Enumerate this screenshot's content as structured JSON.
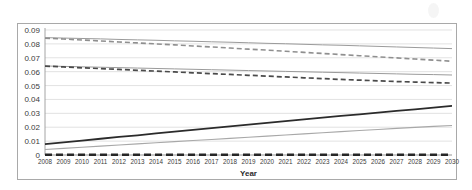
{
  "chart_data": {
    "type": "line",
    "title": "",
    "xlabel": "Year",
    "ylabel": "",
    "grid": true,
    "legend": "none",
    "xlim": [
      2008,
      2030
    ],
    "ylim": [
      0,
      0.09
    ],
    "ytick_labels": [
      "0.09",
      "0.08",
      "0.07",
      "0.06",
      "0.05",
      "0.04",
      "0.03",
      "0.02",
      "0.01",
      "0"
    ],
    "ytick_values": [
      0.09,
      0.08,
      0.07,
      0.06,
      0.05,
      0.04,
      0.03,
      0.02,
      0.01,
      0
    ],
    "categories": [
      2008,
      2009,
      2010,
      2011,
      2012,
      2013,
      2014,
      2015,
      2016,
      2017,
      2018,
      2019,
      2020,
      2021,
      2022,
      2023,
      2024,
      2025,
      2026,
      2027,
      2028,
      2029,
      2030
    ],
    "series": [
      {
        "name": "upper-solid-gray",
        "style": "solid",
        "color": "#9b9b9b",
        "width": 1.0,
        "values": [
          0.0845,
          0.0842,
          0.0839,
          0.0836,
          0.0832,
          0.0829,
          0.0826,
          0.0822,
          0.0819,
          0.0815,
          0.0812,
          0.0808,
          0.0804,
          0.0801,
          0.0797,
          0.0793,
          0.079,
          0.0786,
          0.0782,
          0.0778,
          0.0774,
          0.077,
          0.0766
        ]
      },
      {
        "name": "upper-dashed-gray",
        "style": "dashed",
        "color": "#8f8f8f",
        "width": 1.6,
        "values": [
          0.0841,
          0.0835,
          0.0828,
          0.0821,
          0.0814,
          0.0807,
          0.08,
          0.0793,
          0.0785,
          0.0778,
          0.077,
          0.0762,
          0.0755,
          0.0747,
          0.0739,
          0.0731,
          0.0723,
          0.0715,
          0.0707,
          0.0699,
          0.0691,
          0.0683,
          0.0675
        ]
      },
      {
        "name": "middle-solid-gray",
        "style": "solid",
        "color": "#9b9b9b",
        "width": 1.0,
        "values": [
          0.0641,
          0.0638,
          0.0635,
          0.0632,
          0.0629,
          0.0626,
          0.0623,
          0.062,
          0.0617,
          0.0614,
          0.0611,
          0.0608,
          0.0605,
          0.0602,
          0.0599,
          0.0596,
          0.0593,
          0.059,
          0.0587,
          0.0584,
          0.0581,
          0.0579,
          0.0576
        ]
      },
      {
        "name": "middle-dashed-black",
        "style": "dashed",
        "color": "#4a4a4a",
        "width": 1.7,
        "values": [
          0.064,
          0.0634,
          0.0628,
          0.0622,
          0.0616,
          0.061,
          0.0604,
          0.0598,
          0.0592,
          0.0586,
          0.058,
          0.0574,
          0.0568,
          0.0562,
          0.0556,
          0.055,
          0.0544,
          0.0539,
          0.0534,
          0.0529,
          0.0525,
          0.0521,
          0.0518
        ]
      },
      {
        "name": "rising-solid-black",
        "style": "solid",
        "color": "#2b2b2b",
        "width": 1.8,
        "values": [
          0.0078,
          0.0091,
          0.0104,
          0.0117,
          0.013,
          0.0142,
          0.0155,
          0.0168,
          0.0181,
          0.0194,
          0.0206,
          0.0219,
          0.0232,
          0.0244,
          0.0256,
          0.0269,
          0.0281,
          0.0293,
          0.0305,
          0.0317,
          0.0329,
          0.0341,
          0.0353
        ]
      },
      {
        "name": "rising-solid-gray",
        "style": "solid",
        "color": "#a8a8a8",
        "width": 1.1,
        "values": [
          0.004,
          0.0048,
          0.0056,
          0.0064,
          0.0072,
          0.008,
          0.0088,
          0.0096,
          0.0104,
          0.0112,
          0.012,
          0.0128,
          0.0136,
          0.0144,
          0.0152,
          0.016,
          0.0168,
          0.0176,
          0.0184,
          0.0192,
          0.0199,
          0.0206,
          0.0212
        ]
      },
      {
        "name": "baseline-dashed-black",
        "style": "dashed-thick",
        "color": "#262626",
        "width": 2.6,
        "values": [
          0.0002,
          0.0002,
          0.0002,
          0.0002,
          0.0002,
          0.0002,
          0.0002,
          0.0002,
          0.0002,
          0.0002,
          0.0002,
          0.0002,
          0.0002,
          0.0002,
          0.0002,
          0.0002,
          0.0002,
          0.0002,
          0.0002,
          0.0002,
          0.0002,
          0.0002,
          0.0002
        ]
      }
    ]
  },
  "colors": {
    "grid": "#d6d6d6",
    "axis": "#9a9a9a",
    "border": "#a9a9a9",
    "text": "#3b3b3b",
    "background": "#ffffff"
  }
}
